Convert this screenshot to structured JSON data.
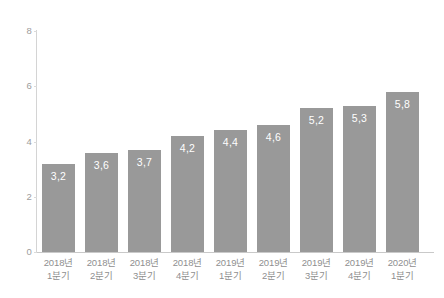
{
  "chart_data": {
    "type": "bar",
    "title": "",
    "subtitle": "",
    "xlabel": "",
    "ylabel": "",
    "ylim": [
      0,
      8
    ],
    "y_ticks": [
      "0",
      "2",
      "4",
      "6",
      "8"
    ],
    "y_tick_values": [
      0,
      2,
      4,
      6,
      8
    ],
    "grid": false,
    "legend": null,
    "decimal_separator": ",",
    "categories": [
      "2018년 1분기",
      "2018년 2분기",
      "2018년 3분기",
      "2018년 4분기",
      "2019년 1분기",
      "2019년 2분기",
      "2019년 3분기",
      "2019년 4분기",
      "2020년 1분기"
    ],
    "category_lines": [
      {
        "line1": "2018년",
        "line2": "1분기"
      },
      {
        "line1": "2018년",
        "line2": "2분기"
      },
      {
        "line1": "2018년",
        "line2": "3분기"
      },
      {
        "line1": "2018년",
        "line2": "4분기"
      },
      {
        "line1": "2019년",
        "line2": "1분기"
      },
      {
        "line1": "2019년",
        "line2": "2분기"
      },
      {
        "line1": "2019년",
        "line2": "3분기"
      },
      {
        "line1": "2019년",
        "line2": "4분기"
      },
      {
        "line1": "2020년",
        "line2": "1분기"
      }
    ],
    "values": [
      3.2,
      3.6,
      3.7,
      4.2,
      4.4,
      4.6,
      5.2,
      5.3,
      5.8
    ],
    "value_labels": [
      "3,2",
      "3,6",
      "3,7",
      "4,2",
      "4,4",
      "4,6",
      "5,2",
      "5,3",
      "5,8"
    ],
    "colors": {
      "bar_fill": "#999999",
      "value_label": "#ffffff",
      "tick_label": "#9d9d9d",
      "category_label": "#8f8f8f",
      "axis_line": "#d4d4d4",
      "background": "#ffffff"
    }
  }
}
